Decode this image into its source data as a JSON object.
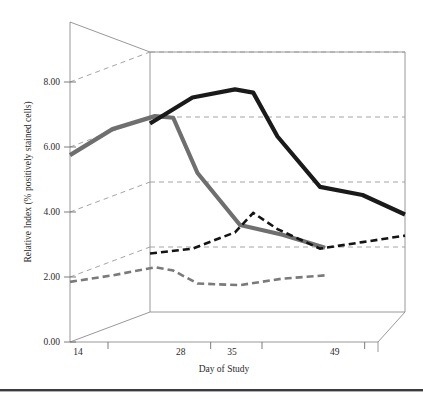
{
  "chart_data": {
    "type": "line",
    "title": "",
    "xlabel": "Day of Study",
    "ylabel": "Relative Index (% positively stained cells)",
    "projection": "3d",
    "grid": true,
    "legend": "none",
    "ylim": [
      0.0,
      8.0
    ],
    "yticks": [
      "0.00",
      "2.00",
      "4.00",
      "6.00",
      "8.00"
    ],
    "ytick_values": [
      0.0,
      2.0,
      4.0,
      6.0,
      8.0
    ],
    "xticks": [
      "14",
      "28",
      "35",
      "49"
    ],
    "xtick_values": [
      14,
      28,
      35,
      49
    ],
    "x": [
      14,
      21,
      28,
      31,
      35,
      42,
      49,
      56
    ],
    "series": [
      {
        "name": "solid-gray-front",
        "color": "#6f6f6f",
        "style": "solid",
        "depth_row": 0,
        "values": [
          5.75,
          6.55,
          6.95,
          6.9,
          5.2,
          3.6,
          3.3,
          2.9
        ]
      },
      {
        "name": "solid-black-back",
        "color": "#1a1a1a",
        "style": "solid",
        "depth_row": 1,
        "values": [
          5.8,
          6.6,
          6.85,
          6.75,
          5.4,
          3.85,
          3.6,
          3.0
        ]
      },
      {
        "name": "dashed-gray-front",
        "color": "#7a7a7a",
        "style": "dashed",
        "depth_row": 0,
        "values": [
          1.85,
          2.05,
          2.3,
          2.2,
          1.8,
          1.75,
          1.95,
          2.05
        ]
      },
      {
        "name": "dashed-black-back",
        "color": "#141414",
        "style": "dashed",
        "depth_row": 1,
        "values": [
          1.8,
          1.95,
          2.45,
          3.05,
          2.55,
          1.95,
          2.15,
          2.35
        ]
      }
    ]
  },
  "axes": {
    "y_title": "Relative Index (% positively stained cells)",
    "x_title": "Day of Study",
    "y_labels": [
      "8.00",
      "6.00",
      "4.00",
      "2.00",
      "0.00"
    ],
    "x_labels": [
      "14",
      "28",
      "35",
      "49"
    ]
  }
}
